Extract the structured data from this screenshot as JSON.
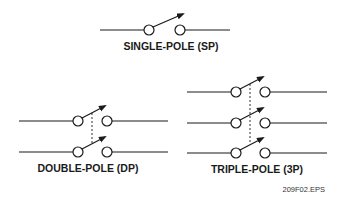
{
  "diagram": {
    "figure_id": "209F02.EPS",
    "colors": {
      "line": "#1a1a1a",
      "background": "#ffffff"
    },
    "switches": [
      {
        "id": "sp",
        "label": "SINGLE-POLE (SP)",
        "poles": 1
      },
      {
        "id": "dp",
        "label": "DOUBLE-POLE (DP)",
        "poles": 2
      },
      {
        "id": "3p",
        "label": "TRIPLE-POLE (3P)",
        "poles": 3
      }
    ]
  }
}
